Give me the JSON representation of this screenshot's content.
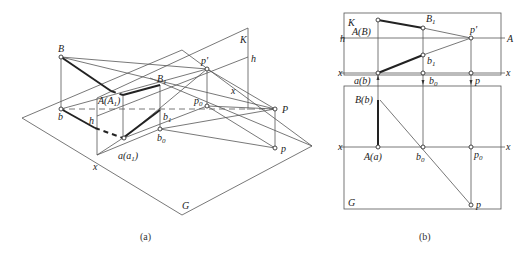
{
  "figure_a": {
    "caption": "(a)",
    "labels": {
      "B": "B",
      "b": "b",
      "h": "h",
      "A_A1": "A(A",
      "A_A1_sub": "1",
      "A_A1_close": ")",
      "B1": "B",
      "B1_sub": "1",
      "b1": "b",
      "b1_sub": "1",
      "b0": "b",
      "b0_sub": "0",
      "a_a1": "a(a",
      "a_a1_sub": "1",
      "a_a1_close": ")",
      "x": "x",
      "G": "G",
      "K": "K",
      "h_right": "h",
      "p_prime": "p'",
      "p0": "p",
      "p0_sub": "0",
      "x_mid": "x",
      "P": "P",
      "p": "p"
    }
  },
  "figure_b": {
    "caption": "(b)",
    "labels": {
      "K": "K",
      "A_B": "A(B)",
      "B1": "B",
      "B1_sub": "1",
      "p_prime": "p'",
      "h_left": "h",
      "A_right": "A",
      "b1": "b",
      "b1_sub": "1",
      "x_left_top": "x",
      "x_right_top": "x",
      "a_b": "a(b)",
      "b0_top": "b",
      "b0_top_sub": "0",
      "p_top": "p",
      "B_b": "B(b)",
      "x_left_bottom": "x",
      "x_right_bottom": "x",
      "A_a": "A(a)",
      "b0_bottom": "b",
      "b0_bottom_sub": "0",
      "p0": "p",
      "p0_sub": "0",
      "G": "G",
      "p": "p"
    }
  }
}
